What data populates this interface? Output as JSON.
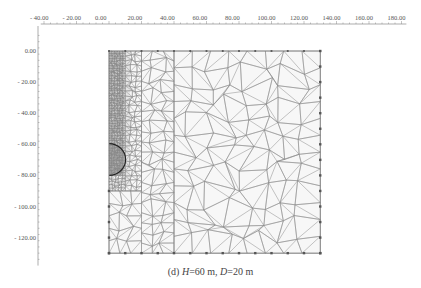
{
  "figure": {
    "caption_prefix": "(d)",
    "caption_H_var": "H",
    "caption_H_val": "=60 m,",
    "caption_D_var": "D",
    "caption_D_val": "=20 m"
  },
  "axes": {
    "x_ticks": [
      "- 40.00",
      "- 20.00",
      "0.00",
      "20.00",
      "40.00",
      "60.00",
      "80.00",
      "100.00",
      "120.00",
      "140.00",
      "160.00",
      "180.00"
    ],
    "x_values": [
      -40,
      -20,
      0,
      20,
      40,
      60,
      80,
      100,
      120,
      140,
      160,
      180
    ],
    "y_ticks": [
      "0.00",
      "- 20.00",
      "- 40.00",
      "- 60.00",
      "- 80.00",
      "- 100.00",
      "- 120.00"
    ],
    "y_values": [
      0,
      -20,
      -40,
      -60,
      -80,
      -100,
      -120
    ]
  },
  "mesh": {
    "x_range": [
      0,
      130
    ],
    "y_range": [
      -130,
      0
    ],
    "tunnel": {
      "center_x": 0,
      "center_y": -70,
      "radius": 10
    },
    "refined_zones": [
      {
        "name": "very-fine",
        "x": [
          0,
          10
        ],
        "y": [
          -80,
          0
        ]
      },
      {
        "name": "fine",
        "x": [
          0,
          20
        ],
        "y": [
          -90,
          0
        ]
      },
      {
        "name": "medium",
        "x": [
          0,
          40
        ],
        "y": [
          -130,
          0
        ]
      }
    ],
    "line_color": "#8a8a8a",
    "node_color": "#555555"
  }
}
